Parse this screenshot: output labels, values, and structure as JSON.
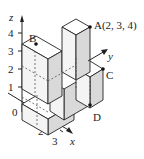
{
  "figure": {
    "type": "isometric-cube-stack",
    "axes": {
      "z": {
        "label": "z",
        "ticks": [
          "1",
          "2",
          "3",
          "4"
        ]
      },
      "x": {
        "label": "x",
        "ticks": [
          "1",
          "2",
          "3"
        ]
      },
      "y": {
        "label": "y"
      },
      "origin_label": "0"
    },
    "points": {
      "A": {
        "label": "A(2, 3, 4)"
      },
      "B": {
        "label": "B"
      },
      "C": {
        "label": "C"
      },
      "D": {
        "label": "D"
      }
    },
    "colors": {
      "line": "#222222",
      "face_top": "#ffffff",
      "face_left": "#f4f4f4",
      "face_right": "#d9d9d9",
      "hidden": "#555555"
    }
  }
}
